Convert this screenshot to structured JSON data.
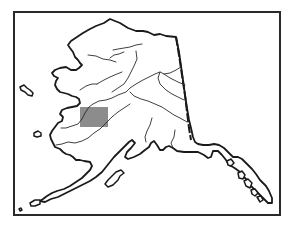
{
  "map": {
    "subject": "Alaska outline map",
    "style": "black-and-white line drawing",
    "frame_color": "#2a2a2a",
    "line_color": "#1a1a1a",
    "background_color": "#ffffff",
    "highlight": {
      "shape": "rectangle",
      "color": "#8c8c8c",
      "region": "western interior Alaska"
    },
    "features": [
      "coastline",
      "rivers",
      "Canada border",
      "Aleutian islands",
      "Southeast panhandle"
    ]
  }
}
